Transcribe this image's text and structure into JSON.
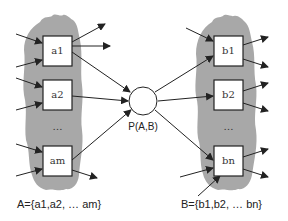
{
  "diagram": {
    "type": "bipartite-node-sets",
    "colors": {
      "cloud": "#a8a8a8",
      "box_fill": "#ffffff",
      "stroke": "#222222",
      "background": "#ffffff"
    },
    "set_a": {
      "nodes": [
        {
          "id": "a1",
          "label": "a1"
        },
        {
          "id": "a2",
          "label": "a2"
        },
        {
          "id": "am",
          "label": "am"
        }
      ],
      "ellipsis": "…",
      "caption": "A={a1,a2, … am}"
    },
    "set_b": {
      "nodes": [
        {
          "id": "b1",
          "label": "b1"
        },
        {
          "id": "b2",
          "label": "b2"
        },
        {
          "id": "bn",
          "label": "bn"
        }
      ],
      "ellipsis": "…",
      "caption": "B={b1,b2, … bn}"
    },
    "joint": {
      "label": "P(A,B)"
    },
    "edges": [
      {
        "from": "a1",
        "to": "P(A,B)"
      },
      {
        "from": "a2",
        "to": "P(A,B)"
      },
      {
        "from": "am",
        "to": "P(A,B)"
      },
      {
        "from": "P(A,B)",
        "to": "b1"
      },
      {
        "from": "P(A,B)",
        "to": "b2"
      },
      {
        "from": "P(A,B)",
        "to": "bn"
      }
    ]
  }
}
